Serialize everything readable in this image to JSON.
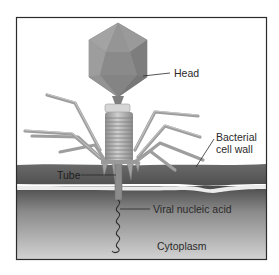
{
  "diagram": {
    "labels": {
      "head": "Head",
      "cell_wall_line1": "Bacterial",
      "cell_wall_line2": "cell wall",
      "tube": "Tube",
      "nucleic_acid": "Viral nucleic acid",
      "cytoplasm": "Cytoplasm"
    },
    "colors": {
      "frame_border": "#2b2b2b",
      "head_fill": "#8e8e8e",
      "head_shade": "#7a7a7a",
      "tail_fill": "#a9a9a9",
      "fiber": "#9c9c9c",
      "cell_wall": "#5a5a5a",
      "membrane": "#e6e6e6",
      "cytoplasm_top": "#4e4e4e",
      "cytoplasm_bottom": "#cfcfcf",
      "label_text": "#2a2a2a"
    }
  }
}
